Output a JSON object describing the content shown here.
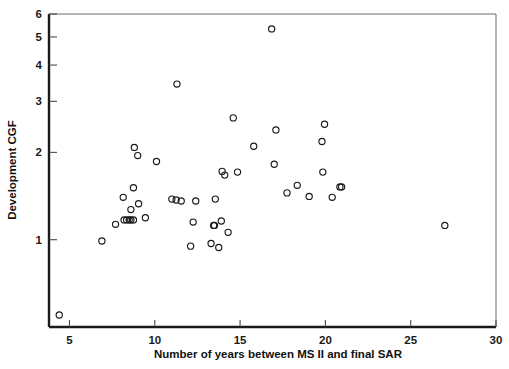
{
  "chart_data": {
    "type": "scatter",
    "title": "",
    "xlabel": "Number of years between MS II and final SAR",
    "ylabel": "Development CGF",
    "xscale": "linear",
    "yscale": "log",
    "xlim": [
      3.8,
      30
    ],
    "ylim": [
      0.5,
      6
    ],
    "grid": false,
    "legend": null,
    "xticks": [
      5,
      10,
      15,
      20,
      25,
      30
    ],
    "xticklabels": [
      "5",
      "10",
      "15",
      "20",
      "25",
      "30"
    ],
    "yticks": [
      1,
      2,
      3,
      4,
      5,
      6
    ],
    "yticklabels": [
      "1",
      "2",
      "3",
      "4",
      "5",
      "6"
    ],
    "marker": "open-circle",
    "marker_color": "#1a1a1a",
    "points": [
      {
        "x": 4.4,
        "y": 0.55
      },
      {
        "x": 6.9,
        "y": 0.99
      },
      {
        "x": 7.7,
        "y": 1.13
      },
      {
        "x": 8.15,
        "y": 1.4
      },
      {
        "x": 8.2,
        "y": 1.17
      },
      {
        "x": 8.35,
        "y": 1.17
      },
      {
        "x": 8.5,
        "y": 1.17
      },
      {
        "x": 8.6,
        "y": 1.17
      },
      {
        "x": 8.75,
        "y": 1.17
      },
      {
        "x": 8.6,
        "y": 1.27
      },
      {
        "x": 8.75,
        "y": 1.51
      },
      {
        "x": 8.8,
        "y": 2.08
      },
      {
        "x": 9.0,
        "y": 1.95
      },
      {
        "x": 9.05,
        "y": 1.33
      },
      {
        "x": 9.45,
        "y": 1.19
      },
      {
        "x": 10.1,
        "y": 1.86
      },
      {
        "x": 11.0,
        "y": 1.38
      },
      {
        "x": 11.25,
        "y": 1.37
      },
      {
        "x": 11.3,
        "y": 3.44
      },
      {
        "x": 11.55,
        "y": 1.36
      },
      {
        "x": 12.1,
        "y": 0.95
      },
      {
        "x": 12.25,
        "y": 1.15
      },
      {
        "x": 12.4,
        "y": 1.36
      },
      {
        "x": 13.3,
        "y": 0.97
      },
      {
        "x": 13.45,
        "y": 1.12
      },
      {
        "x": 13.5,
        "y": 1.12
      },
      {
        "x": 13.55,
        "y": 1.38
      },
      {
        "x": 13.75,
        "y": 0.94
      },
      {
        "x": 13.9,
        "y": 1.16
      },
      {
        "x": 13.95,
        "y": 1.72
      },
      {
        "x": 14.1,
        "y": 1.67
      },
      {
        "x": 14.3,
        "y": 1.06
      },
      {
        "x": 14.6,
        "y": 2.63
      },
      {
        "x": 14.85,
        "y": 1.71
      },
      {
        "x": 15.8,
        "y": 2.1
      },
      {
        "x": 16.85,
        "y": 5.33
      },
      {
        "x": 17.0,
        "y": 1.82
      },
      {
        "x": 17.1,
        "y": 2.39
      },
      {
        "x": 17.75,
        "y": 1.45
      },
      {
        "x": 18.35,
        "y": 1.54
      },
      {
        "x": 19.05,
        "y": 1.41
      },
      {
        "x": 19.8,
        "y": 2.18
      },
      {
        "x": 19.85,
        "y": 1.71
      },
      {
        "x": 19.95,
        "y": 2.5
      },
      {
        "x": 20.4,
        "y": 1.4
      },
      {
        "x": 20.85,
        "y": 1.52
      },
      {
        "x": 20.95,
        "y": 1.52
      },
      {
        "x": 27.0,
        "y": 1.12
      }
    ]
  },
  "axes": {
    "x_title": "Number of years between MS II and final SAR",
    "y_title": "Development CGF"
  }
}
